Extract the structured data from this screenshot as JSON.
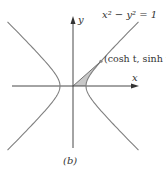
{
  "figure": {
    "equation_label": "x² − y² = 1",
    "point_label": "(cosh t, sinh t)",
    "x_axis_label": "x",
    "y_axis_label": "y",
    "caption": "(b)"
  },
  "colors": {
    "curve": "#808080",
    "axis": "#333333",
    "shade": "#c8c8c8",
    "point": "#888888"
  },
  "geometry": {
    "origin": [
      73,
      86
    ],
    "scale_px_per_unit": 13,
    "t": 1.4
  }
}
